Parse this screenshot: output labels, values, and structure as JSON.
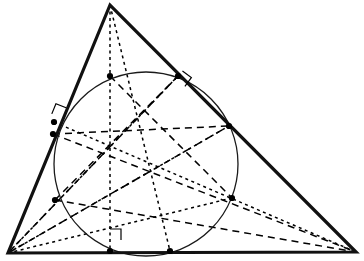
{
  "figure": {
    "type": "geometry-diagram",
    "canvas": {
      "width": 364,
      "height": 261,
      "background": "#ffffff"
    },
    "colors": {
      "stroke": "#000000",
      "triangle_stroke": "#111111",
      "circle_stroke": "#1a1a1a",
      "point_fill": "#000000"
    },
    "strokes": {
      "triangle_width": 3.2,
      "circle_width": 1.3,
      "dashed_width": 1.5,
      "dotted_width": 1.5,
      "marker_width": 1.2,
      "dash_pattern": "7,5",
      "dot_pattern": "3,3.5"
    },
    "point_radius": 3.1
  },
  "chart_data": {
    "type": "scatter",
    "xlabel": "",
    "ylabel": "",
    "xlim": [
      0,
      364
    ],
    "ylim": [
      0,
      261
    ],
    "grid": false,
    "legend": "none",
    "vertices": [
      {
        "name": "apex-vertex",
        "label": "A",
        "x": 110,
        "y": 5
      },
      {
        "name": "bottom-left-vertex",
        "label": "B",
        "x": 8,
        "y": 253
      },
      {
        "name": "bottom-right-vertex",
        "label": "C",
        "x": 356,
        "y": 252
      }
    ],
    "incircle": {
      "cx": 146,
      "cy": 164,
      "r": 92
    },
    "points": [
      {
        "name": "tangent-point-top-left",
        "x": 110,
        "y": 76
      },
      {
        "name": "tangent-point-top-right",
        "x": 178,
        "y": 76
      },
      {
        "name": "point-left-upper",
        "x": 54,
        "y": 122
      },
      {
        "name": "point-left-lower",
        "x": 53,
        "y": 134
      },
      {
        "name": "tangent-point-right-side",
        "x": 229,
        "y": 126
      },
      {
        "name": "point-left-circle",
        "x": 55,
        "y": 200
      },
      {
        "name": "point-right-circle",
        "x": 232,
        "y": 198
      },
      {
        "name": "foot-point-base-left",
        "x": 110,
        "y": 251
      },
      {
        "name": "foot-point-base-right",
        "x": 170,
        "y": 251
      }
    ],
    "centers": [
      {
        "name": "incenter",
        "x": 107,
        "y": 146
      },
      {
        "name": "centroid",
        "x": 148,
        "y": 170
      }
    ],
    "dotted_cevians": [
      {
        "name": "altitude-from-apex",
        "from": [
          110,
          5
        ],
        "to": [
          110,
          251
        ]
      },
      {
        "name": "bisector-from-apex",
        "from": [
          110,
          5
        ],
        "to": [
          170,
          251
        ]
      },
      {
        "name": "cevian-b-to-right-circle",
        "from": [
          8,
          253
        ],
        "to": [
          232,
          198
        ]
      },
      {
        "name": "cevian-b-to-top-right",
        "from": [
          8,
          253
        ],
        "to": [
          178,
          76
        ]
      },
      {
        "name": "cevian-b-to-tangent-right",
        "from": [
          8,
          253
        ],
        "to": [
          229,
          126
        ]
      },
      {
        "name": "cevian-left-upper-to-c",
        "from": [
          54,
          122
        ],
        "to": [
          356,
          252
        ]
      }
    ],
    "dashed_cevians": [
      {
        "name": "dashed-left-upper-to-base-right",
        "from": [
          53,
          134
        ],
        "to": [
          356,
          252
        ]
      },
      {
        "name": "dashed-top-left-to-right-circle",
        "from": [
          110,
          76
        ],
        "to": [
          232,
          198
        ]
      },
      {
        "name": "dashed-top-right-to-left-circle",
        "from": [
          178,
          76
        ],
        "to": [
          55,
          200
        ]
      },
      {
        "name": "dashed-left-lower-to-tangent-r",
        "from": [
          53,
          134
        ],
        "to": [
          229,
          126
        ]
      },
      {
        "name": "dashed-b-to-tangent-right",
        "from": [
          8,
          253
        ],
        "to": [
          229,
          126
        ]
      },
      {
        "name": "dashed-left-circle-to-c",
        "from": [
          55,
          200
        ],
        "to": [
          356,
          252
        ]
      },
      {
        "name": "dashed-b-to-top-right",
        "from": [
          8,
          253
        ],
        "to": [
          178,
          76
        ]
      }
    ],
    "right_angle_markers": [
      {
        "name": "right-angle-left-side",
        "x": 62,
        "y": 118,
        "size": 11,
        "rotation": -68
      },
      {
        "name": "right-angle-right-side",
        "x": 176,
        "y": 80,
        "size": 11,
        "rotation": 36
      },
      {
        "name": "right-angle-base",
        "x": 110,
        "y": 240,
        "size": 11,
        "rotation": 0
      }
    ]
  }
}
